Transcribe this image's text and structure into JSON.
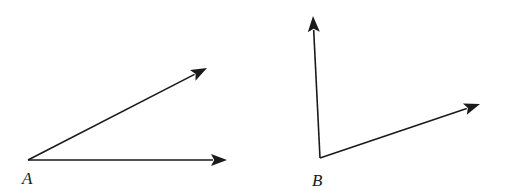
{
  "diagram": {
    "type": "angle-vectors",
    "stroke_color": "#1a1a1a",
    "background": "#ffffff",
    "figures": [
      {
        "id": "A",
        "label": "A",
        "vertex": [
          28,
          160
        ],
        "label_pos": [
          22,
          170
        ],
        "rays": [
          {
            "name": "upper-ray",
            "tip": [
              207,
              68
            ]
          },
          {
            "name": "horizontal-ray",
            "tip": [
              227,
              160
            ]
          }
        ]
      },
      {
        "id": "B",
        "label": "B",
        "vertex": [
          320,
          158
        ],
        "label_pos": [
          312,
          172
        ],
        "rays": [
          {
            "name": "vertical-ray",
            "tip": [
              313,
              16
            ]
          },
          {
            "name": "right-ray",
            "tip": [
              480,
              104
            ]
          }
        ]
      }
    ]
  }
}
